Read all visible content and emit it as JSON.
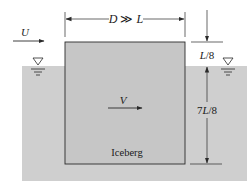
{
  "figure": {
    "labels": {
      "width_dim": "D ≫ L",
      "width_dim_parts": {
        "a": "D",
        "op": " ≫ ",
        "b": "L"
      },
      "top_dim": "L/8",
      "top_dim_parts": {
        "a": "L",
        "b": "/8"
      },
      "bottom_dim": "7L/8",
      "bottom_dim_parts": {
        "pre": "7",
        "a": "L",
        "b": "/8"
      },
      "stream_velocity": "U",
      "iceberg_velocity": "V",
      "body_name": "Iceberg"
    },
    "symbols": {
      "free_surface_left": "free-surface-triangle",
      "free_surface_right": "free-surface-triangle"
    },
    "colors": {
      "water": "#cfcfcf",
      "iceberg": "#c6c6c6",
      "line": "#2a2a2a",
      "background": "#ffffff"
    }
  }
}
